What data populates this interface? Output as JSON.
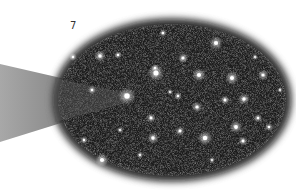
{
  "figure": {
    "label": "7",
    "colors": {
      "background": "#ffffff",
      "field": "#1a1a1a",
      "beam": "#9a9a9a",
      "star": "#ffffff"
    },
    "oval": {
      "cx": 172,
      "cy": 100,
      "rx": 118,
      "ry": 80
    },
    "beam": {
      "points": "0,64 120,92 120,104 0,142"
    },
    "stars": [
      {
        "x": 156,
        "y": 73,
        "r": 3.2
      },
      {
        "x": 127,
        "y": 96,
        "r": 3.4
      },
      {
        "x": 216,
        "y": 43,
        "r": 2.6
      },
      {
        "x": 183,
        "y": 58,
        "r": 2
      },
      {
        "x": 155,
        "y": 68,
        "r": 1.5
      },
      {
        "x": 199,
        "y": 75,
        "r": 2.6
      },
      {
        "x": 232,
        "y": 78,
        "r": 2.6
      },
      {
        "x": 263,
        "y": 75,
        "r": 2
      },
      {
        "x": 244,
        "y": 99,
        "r": 2.2
      },
      {
        "x": 225,
        "y": 100,
        "r": 1.8
      },
      {
        "x": 197,
        "y": 107,
        "r": 2
      },
      {
        "x": 178,
        "y": 96,
        "r": 1.5
      },
      {
        "x": 236,
        "y": 127,
        "r": 2.4
      },
      {
        "x": 205,
        "y": 138,
        "r": 2.8
      },
      {
        "x": 180,
        "y": 131,
        "r": 1.8
      },
      {
        "x": 153,
        "y": 138,
        "r": 2.2
      },
      {
        "x": 151,
        "y": 118,
        "r": 1.8
      },
      {
        "x": 102,
        "y": 160,
        "r": 2.6
      },
      {
        "x": 243,
        "y": 141,
        "r": 1.8
      },
      {
        "x": 269,
        "y": 127,
        "r": 1.6
      },
      {
        "x": 258,
        "y": 118,
        "r": 1.6
      },
      {
        "x": 73,
        "y": 57,
        "r": 1.5
      },
      {
        "x": 100,
        "y": 56,
        "r": 2.2
      },
      {
        "x": 118,
        "y": 55,
        "r": 1.5
      },
      {
        "x": 163,
        "y": 33,
        "r": 1.5
      },
      {
        "x": 92,
        "y": 90,
        "r": 1.6
      },
      {
        "x": 84,
        "y": 140,
        "r": 1.5
      },
      {
        "x": 170,
        "y": 92,
        "r": 1.2
      },
      {
        "x": 140,
        "y": 155,
        "r": 1.3
      },
      {
        "x": 255,
        "y": 57,
        "r": 1.2
      },
      {
        "x": 212,
        "y": 160,
        "r": 1.2
      },
      {
        "x": 120,
        "y": 130,
        "r": 1.2
      },
      {
        "x": 280,
        "y": 90,
        "r": 1.1
      }
    ]
  }
}
